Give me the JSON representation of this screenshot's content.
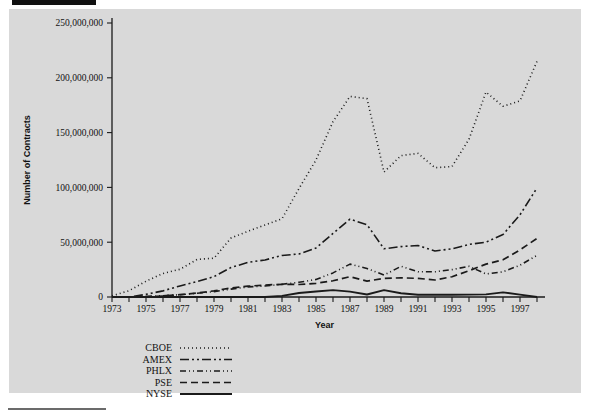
{
  "figure": {
    "bg_color": "#d9d9d9",
    "page_color": "#ffffff",
    "ink_color": "#1a1a1a"
  },
  "chart_data": {
    "type": "line",
    "title": "",
    "xlabel": "Year",
    "ylabel": "Number of Contracts",
    "xlim": [
      1973,
      1998
    ],
    "ylim": [
      0,
      250000000
    ],
    "grid": false,
    "legend_position": "below-left",
    "ytick_labels": [
      "0",
      "50,000,000",
      "100,000,000",
      "150,000,000",
      "200,000,000",
      "250,000,000"
    ],
    "ytick_values": [
      0,
      50000000,
      100000000,
      150000000,
      200000000,
      250000000
    ],
    "xtick_labels": [
      "1973",
      "1975",
      "1977",
      "1979",
      "1981",
      "1983",
      "1985",
      "1987",
      "1989",
      "1991",
      "1993",
      "1995",
      "1997"
    ],
    "xtick_values": [
      1973,
      1975,
      1977,
      1979,
      1981,
      1983,
      1985,
      1987,
      1989,
      1991,
      1993,
      1995,
      1997
    ],
    "x": [
      1973,
      1974,
      1975,
      1976,
      1977,
      1978,
      1979,
      1980,
      1981,
      1982,
      1983,
      1984,
      1985,
      1986,
      1987,
      1988,
      1989,
      1990,
      1991,
      1992,
      1993,
      1994,
      1995,
      1996,
      1997,
      1998
    ],
    "series": [
      {
        "name": "CBOE",
        "dash": "1,3",
        "width": 1.6,
        "values": [
          1100000,
          5700000,
          14400000,
          21500000,
          25300000,
          34300000,
          35400000,
          53800000,
          60000000,
          65700000,
          71400000,
          99000000,
          125000000,
          160000000,
          183000000,
          181000000,
          114000000,
          129000000,
          131000000,
          118000000,
          119000000,
          144000000,
          187000000,
          174000000,
          179000000,
          215000000
        ]
      },
      {
        "name": "AMEX",
        "dash": "9,3,2,3,2,3",
        "width": 1.6,
        "values": [
          0,
          0,
          2400000,
          5600000,
          10100000,
          14000000,
          18600000,
          26900000,
          31600000,
          33800000,
          37900000,
          39300000,
          44700000,
          58000000,
          71000000,
          66000000,
          44000000,
          46000000,
          47000000,
          42000000,
          44000000,
          48000000,
          50000000,
          57000000,
          75000000,
          99500000
        ]
      },
      {
        "name": "PHLX",
        "dash": "6,3,1,3,1,3",
        "width": 1.6,
        "values": [
          0,
          0,
          500000,
          1200000,
          2100000,
          3400000,
          4900000,
          7200000,
          9200000,
          10000000,
          11600000,
          13400000,
          16000000,
          22000000,
          30000000,
          26000000,
          20000000,
          28000000,
          23000000,
          23000000,
          25000000,
          28000000,
          21000000,
          23000000,
          29000000,
          38000000
        ]
      },
      {
        "name": "PSE",
        "dash": "7,4",
        "width": 1.7,
        "values": [
          0,
          0,
          300000,
          900000,
          2100000,
          3600000,
          5600000,
          8300000,
          9900000,
          10900000,
          11600000,
          11400000,
          12500000,
          14800000,
          18500000,
          14500000,
          17000000,
          17500000,
          17000000,
          15500000,
          18500000,
          24000000,
          30000000,
          34000000,
          43000000,
          53500000
        ]
      },
      {
        "name": "NYSE",
        "dash": "0",
        "width": 1.9,
        "values": [
          0,
          0,
          0,
          0,
          0,
          0,
          0,
          0,
          0,
          0,
          1000000,
          3600000,
          5000000,
          6300000,
          4900000,
          2300000,
          6300000,
          3400000,
          2100000,
          2000000,
          2000000,
          2200000,
          2400000,
          4200000,
          2200000,
          0
        ]
      }
    ]
  },
  "legend": {
    "entries": [
      {
        "label": "CBOE"
      },
      {
        "label": "AMEX"
      },
      {
        "label": "PHLX"
      },
      {
        "label": "PSE"
      },
      {
        "label": "NYSE"
      }
    ]
  }
}
